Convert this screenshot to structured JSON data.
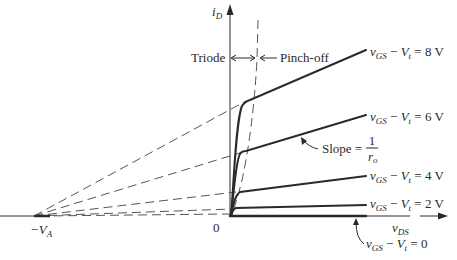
{
  "figure": {
    "type": "MOSFET output characteristics (iD vs vDS) with channel-length modulation",
    "colors": {
      "ink": "#2a2a2a",
      "dashed": "#555555",
      "background": "#ffffff"
    }
  },
  "axes": {
    "y_label": "i",
    "y_label_sub": "D",
    "x_label": "v",
    "x_label_sub": "DS",
    "origin_label": "0",
    "va_label_minus": "−V",
    "va_label_sub": "A"
  },
  "regions": {
    "triode_label": "Triode",
    "pinchoff_label": "Pinch-off"
  },
  "slope_annotation": {
    "text": "Slope =",
    "numerator": "1",
    "denominator": "r",
    "denominator_sub": "o"
  },
  "curves": [
    {
      "id": "vov-8",
      "v": "v",
      "v_sub": "GS",
      "minus": " − ",
      "vt": "V",
      "vt_sub": "t",
      "eq": " = 8 V"
    },
    {
      "id": "vov-6",
      "v": "v",
      "v_sub": "GS",
      "minus": " − ",
      "vt": "V",
      "vt_sub": "t",
      "eq": " = 6 V"
    },
    {
      "id": "vov-4",
      "v": "v",
      "v_sub": "GS",
      "minus": " − ",
      "vt": "V",
      "vt_sub": "t",
      "eq": " = 4 V"
    },
    {
      "id": "vov-2",
      "v": "v",
      "v_sub": "GS",
      "minus": " − ",
      "vt": "V",
      "vt_sub": "t",
      "eq": " = 2 V"
    },
    {
      "id": "vov-0",
      "v": "v",
      "v_sub": "GS",
      "minus": " − ",
      "vt": "V",
      "vt_sub": "t",
      "eq": " = 0"
    }
  ]
}
